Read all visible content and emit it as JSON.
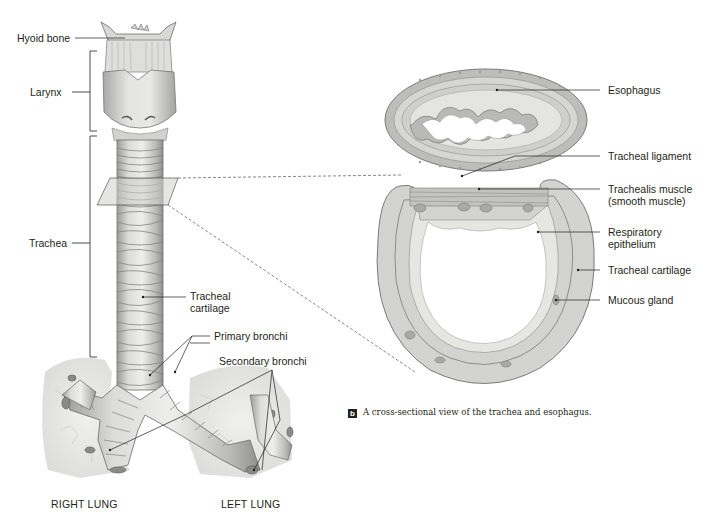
{
  "figure": {
    "left_panel": {
      "labels": {
        "hyoid_bone": "Hyoid bone",
        "larynx": "Larynx",
        "trachea": "Trachea",
        "tracheal_cartilage_line1": "Tracheal",
        "tracheal_cartilage_line2": "cartilage",
        "primary_bronchi": "Primary bronchi",
        "secondary_bronchi": "Secondary bronchi",
        "right_lung": "RIGHT LUNG",
        "left_lung": "LEFT LUNG"
      }
    },
    "right_panel": {
      "labels": {
        "esophagus": "Esophagus",
        "tracheal_ligament": "Tracheal ligament",
        "trachealis_muscle_line1": "Trachealis muscle",
        "trachealis_muscle_line2": "(smooth muscle)",
        "respiratory_epithelium_line1": "Respiratory",
        "respiratory_epithelium_line2": "epithelium",
        "tracheal_cartilage": "Tracheal cartilage",
        "mucous_gland": "Mucous gland"
      },
      "caption": {
        "badge": "b",
        "text": "A cross-sectional view of the trachea and esophagus."
      }
    },
    "colors": {
      "ink": "#231f20",
      "cartilage_fill": "#d3d3d1",
      "tissue_fill": "#e6e6e3",
      "lung_fill": "#ececea",
      "esophagus_fill": "#c9c9c6"
    }
  }
}
